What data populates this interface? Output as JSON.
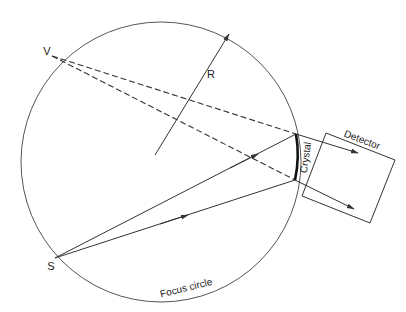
{
  "diagram": {
    "labels": {
      "virtual_source": "V",
      "source": "S",
      "radius": "R",
      "crystal": "Crystal",
      "detector": "Detector",
      "focus_circle": "Focus circle"
    },
    "colors": {
      "line": "#333333",
      "circle": "#555555",
      "background": "#ffffff"
    },
    "geometry": {
      "circle": {
        "cx": 161,
        "cy": 162,
        "r": 140
      },
      "points": {
        "V": [
          52,
          56
        ],
        "S": [
          55,
          258
        ],
        "crystal_top": [
          296,
          134
        ],
        "crystal_bottom": [
          295,
          180
        ],
        "radius_start": [
          155,
          155
        ],
        "radius_end": [
          229,
          34
        ]
      },
      "detector_box": [
        [
          326,
          133
        ],
        [
          395,
          160
        ],
        [
          370,
          223
        ],
        [
          302,
          196
        ]
      ]
    }
  }
}
